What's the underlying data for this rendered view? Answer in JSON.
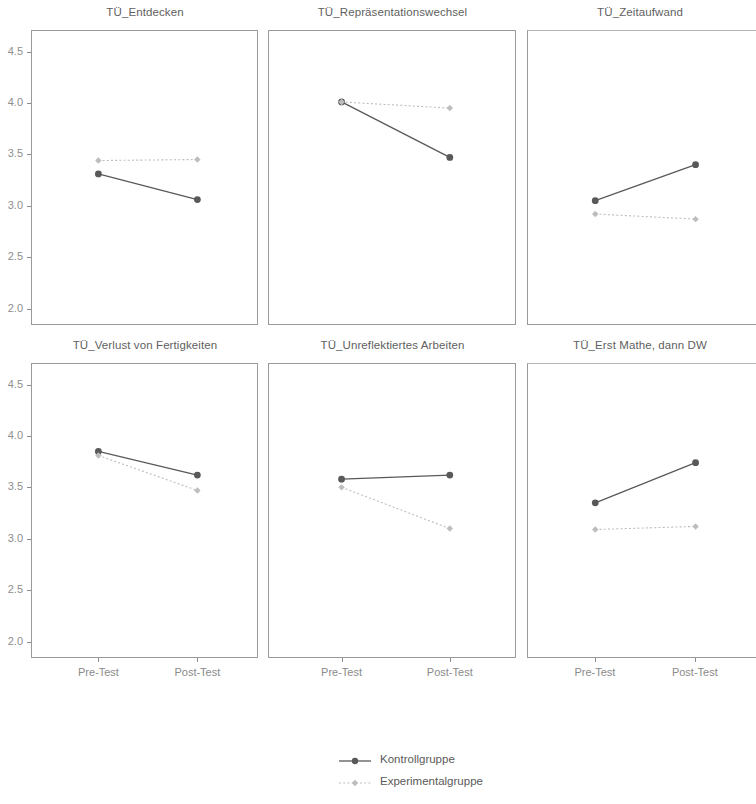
{
  "chart_data": {
    "type": "line",
    "title": "",
    "xlabel": "",
    "ylabel": "",
    "categories": [
      "Pre-Test",
      "Post-Test"
    ],
    "ylim": [
      1.85,
      4.7
    ],
    "yticks": [
      4.5,
      4.0,
      3.5,
      3.0,
      2.5,
      2.0
    ],
    "ytick_labels": [
      "4.5",
      "4.0",
      "3.5",
      "3.0",
      "2.5",
      "2.0"
    ],
    "grid": false,
    "legend_position": "bottom-center",
    "series_names": [
      "Kontrollgruppe",
      "Experimentalgruppe"
    ],
    "series_colors": [
      "#595959",
      "#bdbdbd"
    ],
    "panels": [
      {
        "title": "TÜ_Entdecken",
        "series": [
          {
            "name": "Kontrollgruppe",
            "values": [
              3.31,
              3.06
            ]
          },
          {
            "name": "Experimentalgruppe",
            "values": [
              3.44,
              3.45
            ]
          }
        ]
      },
      {
        "title": "TÜ_Repräsentationswechsel",
        "series": [
          {
            "name": "Kontrollgruppe",
            "values": [
              4.01,
              3.47
            ]
          },
          {
            "name": "Experimentalgruppe",
            "values": [
              4.01,
              3.95
            ]
          }
        ]
      },
      {
        "title": "TÜ_Zeitaufwand",
        "series": [
          {
            "name": "Kontrollgruppe",
            "values": [
              3.05,
              3.4
            ]
          },
          {
            "name": "Experimentalgruppe",
            "values": [
              2.92,
              2.87
            ]
          }
        ]
      },
      {
        "title": "TÜ_Verlust von Fertigkeiten",
        "series": [
          {
            "name": "Kontrollgruppe",
            "values": [
              3.85,
              3.62
            ]
          },
          {
            "name": "Experimentalgruppe",
            "values": [
              3.81,
              3.47
            ]
          }
        ]
      },
      {
        "title": "TÜ_Unreflektiertes Arbeiten",
        "series": [
          {
            "name": "Kontrollgruppe",
            "values": [
              3.58,
              3.62
            ]
          },
          {
            "name": "Experimentalgruppe",
            "values": [
              3.5,
              3.1
            ]
          }
        ]
      },
      {
        "title": "TÜ_Erst Mathe, dann DW",
        "series": [
          {
            "name": "Kontrollgruppe",
            "values": [
              3.35,
              3.74
            ]
          },
          {
            "name": "Experimentalgruppe",
            "values": [
              3.09,
              3.12
            ]
          }
        ]
      }
    ]
  },
  "legend": {
    "items": [
      {
        "label": "Kontrollgruppe",
        "color": "#595959",
        "style": "solid",
        "marker": "circle"
      },
      {
        "label": "Experimentalgruppe",
        "color": "#bdbdbd",
        "style": "dotted",
        "marker": "diamond"
      }
    ]
  }
}
